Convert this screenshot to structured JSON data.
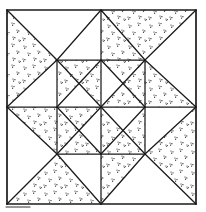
{
  "figure": {
    "canvas": {
      "width": 206,
      "height": 212
    },
    "colors": {
      "paper": "#ffffff",
      "ink": "#1a1a1a",
      "stipple": "#161616"
    },
    "stipple": {
      "tile": 21,
      "dot_radius": 0.62,
      "dots": [
        [
          3,
          4
        ],
        [
          5,
          4.8
        ],
        [
          3.7,
          6.2
        ],
        [
          12,
          2
        ],
        [
          14,
          2.6
        ],
        [
          12.6,
          4.2
        ],
        [
          17,
          9
        ],
        [
          18.8,
          9.9
        ],
        [
          17.5,
          11.2
        ],
        [
          7,
          11
        ],
        [
          9,
          11.6
        ],
        [
          7.6,
          13.2
        ],
        [
          2,
          17
        ],
        [
          3.9,
          17.7
        ],
        [
          2.6,
          19.1
        ],
        [
          13,
          16
        ],
        [
          14.9,
          16.7
        ],
        [
          13.5,
          18.1
        ],
        [
          19,
          19
        ],
        [
          20.8,
          19.6
        ],
        [
          19.4,
          20.9
        ]
      ]
    },
    "stippled_regions": [
      {
        "id": "corner-top-left-west",
        "points": [
          [
            7,
            10
          ],
          [
            57,
            60
          ],
          [
            7,
            107
          ]
        ]
      },
      {
        "id": "corner-top-right-north",
        "points": [
          [
            101,
            10
          ],
          [
            196,
            10
          ],
          [
            145,
            60
          ]
        ]
      },
      {
        "id": "corner-bottom-right-east",
        "points": [
          [
            196,
            107
          ],
          [
            196,
            204
          ],
          [
            145,
            154
          ]
        ]
      },
      {
        "id": "corner-bottom-left-south",
        "points": [
          [
            101,
            204
          ],
          [
            7,
            204
          ],
          [
            57,
            154
          ]
        ]
      },
      {
        "id": "star-point-top-east-half",
        "points": [
          [
            101,
            10
          ],
          [
            101,
            60
          ],
          [
            145,
            60
          ]
        ]
      },
      {
        "id": "star-point-right-north-half",
        "points": [
          [
            145,
            60
          ],
          [
            196,
            107
          ],
          [
            145,
            107
          ]
        ]
      },
      {
        "id": "star-point-bottom-east-half",
        "points": [
          [
            101,
            154
          ],
          [
            145,
            154
          ],
          [
            101,
            204
          ]
        ]
      },
      {
        "id": "star-point-left-south-half",
        "points": [
          [
            7,
            107
          ],
          [
            57,
            107
          ],
          [
            57,
            154
          ]
        ]
      },
      {
        "id": "inner-star-top-west",
        "points": [
          [
            57,
            60
          ],
          [
            101,
            60
          ],
          [
            79,
            83.5
          ]
        ]
      },
      {
        "id": "inner-star-left-north",
        "points": [
          [
            57,
            60
          ],
          [
            57,
            107
          ],
          [
            79,
            83.5
          ]
        ]
      },
      {
        "id": "inner-star-top-east",
        "points": [
          [
            101,
            60
          ],
          [
            145,
            60
          ],
          [
            123,
            83.5
          ]
        ]
      },
      {
        "id": "inner-star-right-north",
        "points": [
          [
            145,
            60
          ],
          [
            145,
            107
          ],
          [
            123,
            83.5
          ]
        ]
      },
      {
        "id": "inner-star-left-south",
        "points": [
          [
            57,
            107
          ],
          [
            57,
            154
          ],
          [
            79,
            130.5
          ]
        ]
      },
      {
        "id": "inner-star-bottom-west",
        "points": [
          [
            57,
            154
          ],
          [
            101,
            154
          ],
          [
            79,
            130.5
          ]
        ]
      },
      {
        "id": "inner-star-right-south",
        "points": [
          [
            145,
            107
          ],
          [
            145,
            154
          ],
          [
            123,
            130.5
          ]
        ]
      },
      {
        "id": "inner-star-bottom-east",
        "points": [
          [
            101,
            154
          ],
          [
            145,
            154
          ],
          [
            123,
            130.5
          ]
        ]
      },
      {
        "id": "center-sector-nnw",
        "points": [
          [
            101,
            60
          ],
          [
            101,
            107
          ],
          [
            79,
            83.5
          ]
        ]
      },
      {
        "id": "center-sector-ene",
        "points": [
          [
            101,
            107
          ],
          [
            145,
            107
          ],
          [
            123,
            83.5
          ]
        ]
      },
      {
        "id": "center-sector-sse",
        "points": [
          [
            101,
            107
          ],
          [
            101,
            154
          ],
          [
            123,
            130.5
          ]
        ]
      },
      {
        "id": "center-sector-wsw",
        "points": [
          [
            57,
            107
          ],
          [
            101,
            107
          ],
          [
            79,
            130.5
          ]
        ]
      }
    ],
    "lines": [
      {
        "role": "outer-border",
        "x1": 7,
        "y1": 10,
        "x2": 196,
        "y2": 10,
        "w": 1.7
      },
      {
        "role": "outer-border",
        "x1": 196,
        "y1": 10,
        "x2": 196,
        "y2": 204,
        "w": 1.7
      },
      {
        "role": "outer-border",
        "x1": 196,
        "y1": 204,
        "x2": 7,
        "y2": 204,
        "w": 1.7
      },
      {
        "role": "outer-border",
        "x1": 7,
        "y1": 204,
        "x2": 7,
        "y2": 10,
        "w": 1.7
      },
      {
        "role": "inner-square",
        "x1": 57,
        "y1": 60,
        "x2": 145,
        "y2": 60,
        "w": 1.25
      },
      {
        "role": "inner-square",
        "x1": 145,
        "y1": 60,
        "x2": 145,
        "y2": 154,
        "w": 1.25
      },
      {
        "role": "inner-square",
        "x1": 145,
        "y1": 154,
        "x2": 57,
        "y2": 154,
        "w": 1.25
      },
      {
        "role": "inner-square",
        "x1": 57,
        "y1": 154,
        "x2": 57,
        "y2": 60,
        "w": 1.25
      },
      {
        "role": "vertical-midline",
        "x1": 101,
        "y1": 10,
        "x2": 101,
        "y2": 204,
        "w": 1.25
      },
      {
        "role": "horizontal-midline",
        "x1": 7,
        "y1": 107,
        "x2": 196,
        "y2": 107,
        "w": 1.25
      },
      {
        "role": "main-diagonal",
        "x1": 7,
        "y1": 10,
        "x2": 57,
        "y2": 60,
        "w": 1.25
      },
      {
        "role": "main-diagonal",
        "x1": 57,
        "y1": 60,
        "x2": 101,
        "y2": 107,
        "w": 1.25
      },
      {
        "role": "main-diagonal",
        "x1": 101,
        "y1": 107,
        "x2": 145,
        "y2": 154,
        "w": 1.25
      },
      {
        "role": "main-diagonal",
        "x1": 145,
        "y1": 154,
        "x2": 196,
        "y2": 204,
        "w": 1.25
      },
      {
        "role": "anti-diagonal",
        "x1": 196,
        "y1": 10,
        "x2": 145,
        "y2": 60,
        "w": 1.25
      },
      {
        "role": "anti-diagonal",
        "x1": 145,
        "y1": 60,
        "x2": 101,
        "y2": 107,
        "w": 1.25
      },
      {
        "role": "anti-diagonal",
        "x1": 101,
        "y1": 107,
        "x2": 57,
        "y2": 154,
        "w": 1.25
      },
      {
        "role": "anti-diagonal",
        "x1": 57,
        "y1": 154,
        "x2": 7,
        "y2": 204,
        "w": 1.25
      },
      {
        "role": "large-diamond",
        "x1": 101,
        "y1": 10,
        "x2": 145,
        "y2": 60,
        "w": 1.25
      },
      {
        "role": "large-diamond",
        "x1": 145,
        "y1": 60,
        "x2": 196,
        "y2": 107,
        "w": 1.25
      },
      {
        "role": "large-diamond",
        "x1": 196,
        "y1": 107,
        "x2": 145,
        "y2": 154,
        "w": 1.25
      },
      {
        "role": "large-diamond",
        "x1": 145,
        "y1": 154,
        "x2": 101,
        "y2": 204,
        "w": 1.25
      },
      {
        "role": "large-diamond",
        "x1": 101,
        "y1": 204,
        "x2": 57,
        "y2": 154,
        "w": 1.25
      },
      {
        "role": "large-diamond",
        "x1": 57,
        "y1": 154,
        "x2": 7,
        "y2": 107,
        "w": 1.25
      },
      {
        "role": "large-diamond",
        "x1": 7,
        "y1": 107,
        "x2": 57,
        "y2": 60,
        "w": 1.25
      },
      {
        "role": "large-diamond",
        "x1": 57,
        "y1": 60,
        "x2": 101,
        "y2": 10,
        "w": 1.25
      },
      {
        "role": "small-diamond",
        "x1": 101,
        "y1": 60,
        "x2": 145,
        "y2": 107,
        "w": 1.25
      },
      {
        "role": "small-diamond",
        "x1": 145,
        "y1": 107,
        "x2": 101,
        "y2": 154,
        "w": 1.25
      },
      {
        "role": "small-diamond",
        "x1": 101,
        "y1": 154,
        "x2": 57,
        "y2": 107,
        "w": 1.25
      },
      {
        "role": "small-diamond",
        "x1": 57,
        "y1": 107,
        "x2": 101,
        "y2": 60,
        "w": 1.25
      },
      {
        "role": "scan-artifact",
        "x1": 6,
        "y1": 207,
        "x2": 30,
        "y2": 207,
        "w": 0.9
      }
    ]
  }
}
